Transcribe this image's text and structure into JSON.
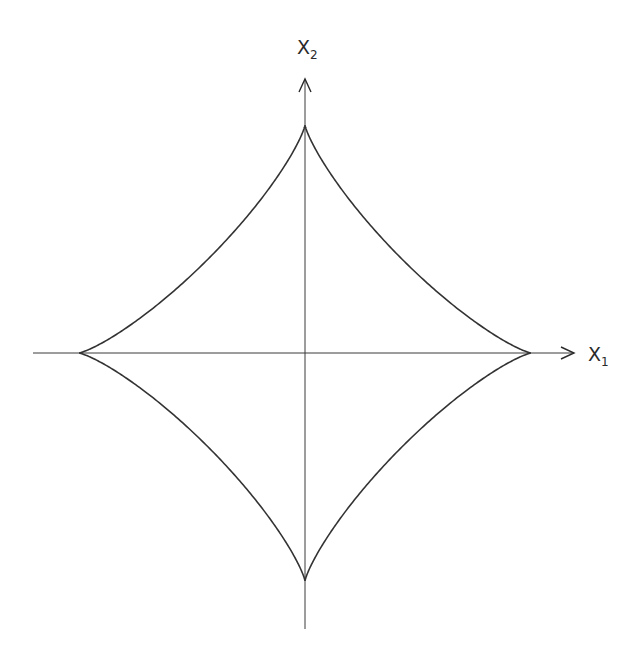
{
  "diagram": {
    "type": "superellipse-astroid-like curve on Cartesian axes",
    "axes": {
      "x": {
        "label": "X",
        "subscript": "1"
      },
      "y": {
        "label": "X",
        "subscript": "2"
      }
    },
    "curve": {
      "description": "Four-cusped star-shaped closed curve (concave sides) with cusps on the axes",
      "cusps": [
        "top",
        "right",
        "bottom",
        "left"
      ]
    },
    "colors": {
      "line": "#333333",
      "background": "#ffffff"
    }
  }
}
